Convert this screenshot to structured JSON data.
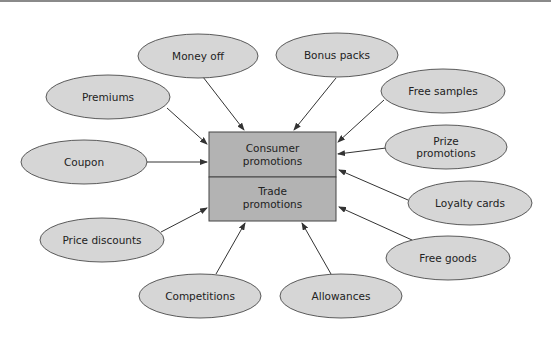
{
  "diagram": {
    "center": {
      "top_label_line1": "Consumer",
      "top_label_line2": "promotions",
      "bottom_label_line1": "Trade",
      "bottom_label_line2": "promotions"
    },
    "nodes": [
      {
        "id": "money-off",
        "label": "Money off",
        "points_to": "consumer"
      },
      {
        "id": "bonus-packs",
        "label": "Bonus packs",
        "points_to": "consumer"
      },
      {
        "id": "premiums",
        "label": "Premiums",
        "points_to": "consumer"
      },
      {
        "id": "free-samples",
        "label": "Free samples",
        "points_to": "consumer"
      },
      {
        "id": "coupon",
        "label": "Coupon",
        "points_to": "consumer"
      },
      {
        "id": "prize-promotions",
        "label_line1": "Prize",
        "label_line2": "promotions",
        "points_to": "consumer"
      },
      {
        "id": "loyalty-cards",
        "label": "Loyalty cards",
        "points_to": "consumer"
      },
      {
        "id": "price-discounts",
        "label": "Price discounts",
        "points_to": "trade"
      },
      {
        "id": "free-goods",
        "label": "Free goods",
        "points_to": "trade"
      },
      {
        "id": "competitions",
        "label": "Competitions",
        "points_to": "trade"
      },
      {
        "id": "allowances",
        "label": "Allowances",
        "points_to": "trade"
      }
    ],
    "colors": {
      "ellipse_fill": "#d6d6d6",
      "box_fill": "#b3b3b3",
      "stroke": "#444444"
    }
  }
}
